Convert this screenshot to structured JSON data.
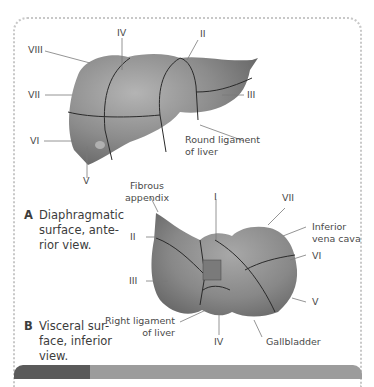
{
  "figure": {
    "panel_a": {
      "letter": "A",
      "caption_lines": [
        "Diaphragmatic",
        "surface, ante-",
        "rior view."
      ],
      "labels": {
        "viii": "VIII",
        "iv": "IV",
        "ii": "II",
        "vii": "VII",
        "iii": "III",
        "vi": "VI",
        "v": "V",
        "round_ligament_1": "Round ligament",
        "round_ligament_2": "of liver"
      }
    },
    "panel_b": {
      "letter": "B",
      "caption_lines": [
        "Visceral sur-",
        "face, inferior",
        "view."
      ],
      "labels": {
        "fibrous_1": "Fibrous",
        "fibrous_2": "appendix",
        "i": "I",
        "vii": "VII",
        "ivc_1": "Inferior",
        "ivc_2": "vena cava",
        "ii": "II",
        "vi": "VI",
        "iii": "III",
        "v": "V",
        "right_lig_1": "Right ligament",
        "right_lig_2": "of liver",
        "iv": "IV",
        "gallbladder": "Gallbladder"
      }
    },
    "colors": {
      "liver_fill": "#8a8a8a",
      "liver_dark": "#6e6e6e",
      "segment_line": "#2a2a2a",
      "leader_line": "#7a7a7a",
      "frame_dots": "#c8c8c8",
      "bar_dark": "#5a5a5a",
      "bar_light": "#9c9c9c"
    }
  }
}
